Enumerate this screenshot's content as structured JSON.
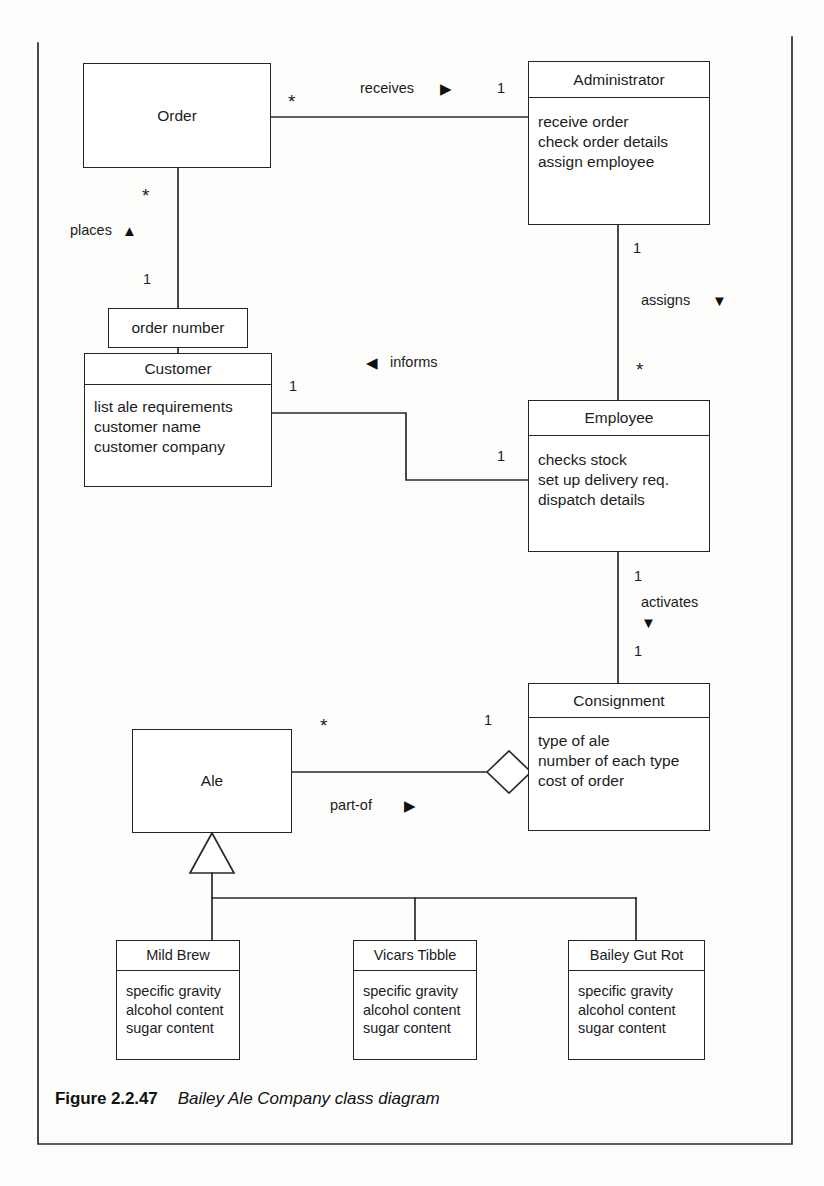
{
  "figure": {
    "number": "Figure 2.2.47",
    "title": "Bailey Ale Company class diagram"
  },
  "diagram": {
    "type": "uml-class-diagram",
    "classes": [
      {
        "id": "order",
        "name": "Order",
        "attributes": [],
        "compartments": 1,
        "x": 83,
        "y": 63,
        "w": 188,
        "h": 105
      },
      {
        "id": "administrator",
        "name": "Administrator",
        "attributes": [
          "receive order",
          "check order details",
          "assign employee"
        ],
        "compartments": 2,
        "x": 528,
        "y": 61,
        "w": 182,
        "h": 164
      },
      {
        "id": "order-number",
        "name": "order number",
        "attributes": [],
        "compartments": 1,
        "x": 108,
        "y": 308,
        "w": 140,
        "h": 40
      },
      {
        "id": "customer",
        "name": "Customer",
        "attributes": [
          "list ale requirements",
          "customer name",
          "customer company"
        ],
        "compartments": 2,
        "x": 84,
        "y": 353,
        "w": 188,
        "h": 134
      },
      {
        "id": "employee",
        "name": "Employee",
        "attributes": [
          "checks stock",
          "set up delivery req.",
          "dispatch details"
        ],
        "compartments": 2,
        "x": 528,
        "y": 400,
        "w": 182,
        "h": 152
      },
      {
        "id": "consignment",
        "name": "Consignment",
        "attributes": [
          "type of ale",
          "number of each type",
          "cost of order"
        ],
        "compartments": 2,
        "x": 528,
        "y": 683,
        "w": 182,
        "h": 148
      },
      {
        "id": "ale",
        "name": "Ale",
        "attributes": [],
        "compartments": 1,
        "x": 132,
        "y": 729,
        "w": 160,
        "h": 104
      },
      {
        "id": "mild-brew",
        "name": "Mild Brew",
        "attributes": [
          "specific gravity",
          "alcohol content",
          "sugar content"
        ],
        "compartments": 2,
        "x": 116,
        "y": 940,
        "w": 124,
        "h": 120
      },
      {
        "id": "vicars-tibble",
        "name": "Vicars Tibble",
        "attributes": [
          "specific gravity",
          "alcohol content",
          "sugar content"
        ],
        "compartments": 2,
        "x": 353,
        "y": 940,
        "w": 124,
        "h": 120
      },
      {
        "id": "bailey-gut-rot",
        "name": "Bailey Gut Rot",
        "attributes": [
          "specific gravity",
          "alcohol content",
          "sugar content"
        ],
        "compartments": 2,
        "x": 568,
        "y": 940,
        "w": 137,
        "h": 120
      }
    ],
    "associations": [
      {
        "id": "order-receives-administrator",
        "label": "receives",
        "direction_marker": "▶",
        "from": "order",
        "to": "administrator",
        "from_multiplicity": "*",
        "to_multiplicity": "1"
      },
      {
        "id": "customer-places-order",
        "label": "places",
        "direction_marker": "▲",
        "from": "customer",
        "to": "order",
        "from_multiplicity": "1",
        "to_multiplicity": "*",
        "qualifier": "order number"
      },
      {
        "id": "employee-informs-customer",
        "label": "informs",
        "direction_marker": "◀",
        "from": "employee",
        "to": "customer",
        "from_multiplicity": "1",
        "to_multiplicity": "1"
      },
      {
        "id": "administrator-assigns-employee",
        "label": "assigns",
        "direction_marker": "▼",
        "from": "administrator",
        "to": "employee",
        "from_multiplicity": "1",
        "to_multiplicity": "*"
      },
      {
        "id": "employee-activates-consignment",
        "label": "activates",
        "direction_marker": "▼",
        "from": "employee",
        "to": "consignment",
        "from_multiplicity": "1",
        "to_multiplicity": "1"
      },
      {
        "id": "ale-part-of-consignment",
        "label": "part-of",
        "direction_marker": "▶",
        "from": "ale",
        "to": "consignment",
        "from_multiplicity": "*",
        "to_multiplicity": "1",
        "relationship": "aggregation"
      }
    ],
    "generalizations": [
      {
        "id": "gen-ale",
        "parent": "ale",
        "children": [
          "mild-brew",
          "vicars-tibble",
          "bailey-gut-rot"
        ]
      }
    ],
    "labels": {
      "receives": "receives",
      "places": "places",
      "informs": "informs",
      "assigns": "assigns",
      "activates": "activates",
      "part_of": "part-of",
      "order_number": "order number"
    },
    "multiplicities": {
      "order_to_admin_star": "*",
      "admin_one": "1",
      "order_down_star": "*",
      "customer_one": "1",
      "customer_right_one": "1",
      "admin_down_one": "1",
      "employee_up_star": "*",
      "employee_left_one": "1",
      "employee_down_one": "1",
      "consignment_up_one": "1",
      "consignment_left_one": "1",
      "ale_right_star": "*"
    },
    "markers": {
      "right_triangle": "▶",
      "left_triangle": "◀",
      "up_triangle": "▲",
      "down_triangle": "▼"
    },
    "colors": {
      "line": "#252525",
      "text": "#1c1c1c",
      "background": "#ffffff"
    }
  }
}
